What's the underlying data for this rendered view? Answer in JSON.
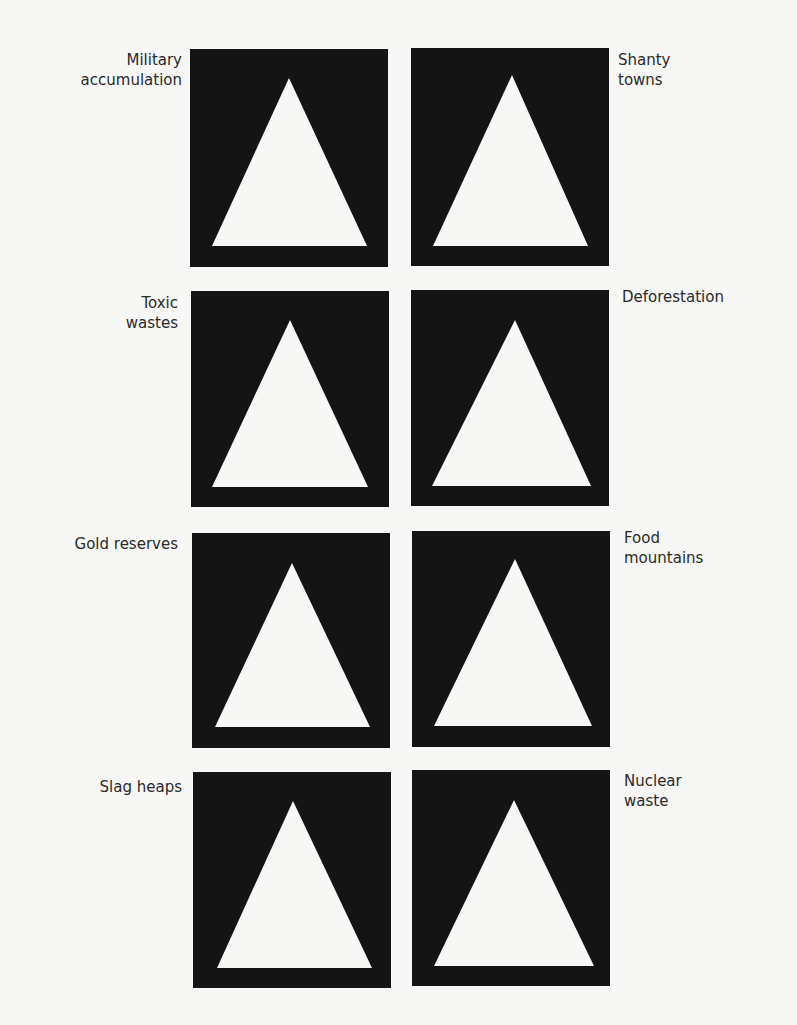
{
  "figure": {
    "panel_color": "#141414",
    "triangle_color": "#f7f7f5",
    "background_color": "#f7f7f5",
    "panels": [
      {
        "label": "Military\naccumulation",
        "side": "left",
        "row": 0
      },
      {
        "label": "Shanty\ntowns",
        "side": "right",
        "row": 0
      },
      {
        "label": "Toxic\nwastes",
        "side": "left",
        "row": 1
      },
      {
        "label": "Deforestation",
        "side": "right",
        "row": 1
      },
      {
        "label": "Gold reserves",
        "side": "left",
        "row": 2
      },
      {
        "label": "Food\nmountains",
        "side": "right",
        "row": 2
      },
      {
        "label": "Slag heaps",
        "side": "left",
        "row": 3
      },
      {
        "label": "Nuclear\nwaste",
        "side": "right",
        "row": 3
      }
    ]
  }
}
